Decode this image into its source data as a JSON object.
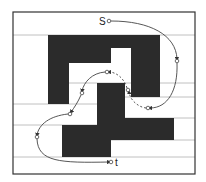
{
  "diagram": {
    "type": "motion-planning-path",
    "colors": {
      "background": "#ffffff",
      "frame": "#333333",
      "obstacle": "#2b2b2b",
      "grid_line": "#aaaaaa",
      "path": "#444444"
    },
    "frame": {
      "x": 13,
      "y": 12,
      "w": 182,
      "h": 162
    },
    "grid_lines_y": [
      35,
      83,
      97,
      104,
      118,
      125,
      140,
      157
    ],
    "obstacles": [
      {
        "name": "outer-c-top",
        "x": 48,
        "y": 35,
        "w": 112,
        "h": 13
      },
      {
        "name": "outer-c-left-top",
        "x": 48,
        "y": 48,
        "w": 63,
        "h": 15
      },
      {
        "name": "outer-c-right-column",
        "x": 131,
        "y": 48,
        "w": 29,
        "h": 49
      },
      {
        "name": "outer-c-left-column",
        "x": 48,
        "y": 63,
        "w": 21,
        "h": 41
      },
      {
        "name": "inner-center-block",
        "x": 97,
        "y": 83,
        "w": 28,
        "h": 35
      },
      {
        "name": "lower-upper-band",
        "x": 97,
        "y": 118,
        "w": 77,
        "h": 22
      },
      {
        "name": "lower-left-block",
        "x": 62,
        "y": 125,
        "w": 49,
        "h": 32
      }
    ],
    "nodes": [
      {
        "id": "s",
        "label": "S",
        "x": 109,
        "y": 21,
        "label_x": 99,
        "label_y": 25
      },
      {
        "id": "n1",
        "label": "",
        "x": 177,
        "y": 61
      },
      {
        "id": "n2",
        "label": "",
        "x": 148,
        "y": 108
      },
      {
        "id": "n3",
        "label": "",
        "x": 128,
        "y": 90
      },
      {
        "id": "n4",
        "label": "",
        "x": 107,
        "y": 72
      },
      {
        "id": "n5",
        "label": "",
        "x": 82,
        "y": 93
      },
      {
        "id": "n6",
        "label": "",
        "x": 70,
        "y": 114
      },
      {
        "id": "n7",
        "label": "",
        "x": 37,
        "y": 137
      },
      {
        "id": "t",
        "label": "t",
        "x": 111,
        "y": 162,
        "label_x": 115,
        "label_y": 166
      }
    ],
    "edges": [
      {
        "from": "s",
        "to": "n1",
        "style": "solid"
      },
      {
        "from": "n1",
        "to": "n2",
        "style": "solid"
      },
      {
        "from": "n2",
        "to": "n3",
        "style": "dashed"
      },
      {
        "from": "n3",
        "to": "n4",
        "style": "dashed"
      },
      {
        "from": "n4",
        "to": "n5",
        "style": "solid"
      },
      {
        "from": "n5",
        "to": "n6",
        "style": "solid"
      },
      {
        "from": "n6",
        "to": "n7",
        "style": "solid"
      },
      {
        "from": "n7",
        "to": "t",
        "style": "solid"
      }
    ],
    "labels": {
      "start": "S",
      "target": "t"
    }
  }
}
